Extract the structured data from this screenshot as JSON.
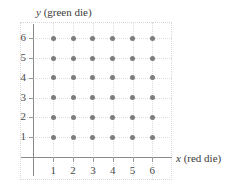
{
  "chart_data": {
    "type": "scatter",
    "title": "",
    "xlabel": "x (red die)",
    "ylabel": "y (green die)",
    "xlabel_var": "x",
    "xlabel_rest": " (red die)",
    "ylabel_var": "y",
    "ylabel_rest": " (green die)",
    "xlim": [
      0,
      7
    ],
    "ylim": [
      0,
      7
    ],
    "xticks": [
      "1",
      "2",
      "3",
      "4",
      "5",
      "6"
    ],
    "yticks": [
      "1",
      "2",
      "3",
      "4",
      "5",
      "6"
    ],
    "grid": true,
    "legend": "none",
    "point_color": "#7d7d7d",
    "axis_color": "#8a8a8a",
    "grid_color": "#dcdcdc",
    "points": [
      {
        "x": 1,
        "y": 1
      },
      {
        "x": 2,
        "y": 1
      },
      {
        "x": 3,
        "y": 1
      },
      {
        "x": 4,
        "y": 1
      },
      {
        "x": 5,
        "y": 1
      },
      {
        "x": 6,
        "y": 1
      },
      {
        "x": 1,
        "y": 2
      },
      {
        "x": 2,
        "y": 2
      },
      {
        "x": 3,
        "y": 2
      },
      {
        "x": 4,
        "y": 2
      },
      {
        "x": 5,
        "y": 2
      },
      {
        "x": 6,
        "y": 2
      },
      {
        "x": 1,
        "y": 3
      },
      {
        "x": 2,
        "y": 3
      },
      {
        "x": 3,
        "y": 3
      },
      {
        "x": 4,
        "y": 3
      },
      {
        "x": 5,
        "y": 3
      },
      {
        "x": 6,
        "y": 3
      },
      {
        "x": 1,
        "y": 4
      },
      {
        "x": 2,
        "y": 4
      },
      {
        "x": 3,
        "y": 4
      },
      {
        "x": 4,
        "y": 4
      },
      {
        "x": 5,
        "y": 4
      },
      {
        "x": 6,
        "y": 4
      },
      {
        "x": 1,
        "y": 5
      },
      {
        "x": 2,
        "y": 5
      },
      {
        "x": 3,
        "y": 5
      },
      {
        "x": 4,
        "y": 5
      },
      {
        "x": 5,
        "y": 5
      },
      {
        "x": 6,
        "y": 5
      },
      {
        "x": 1,
        "y": 6
      },
      {
        "x": 2,
        "y": 6
      },
      {
        "x": 3,
        "y": 6
      },
      {
        "x": 4,
        "y": 6
      },
      {
        "x": 5,
        "y": 6
      },
      {
        "x": 6,
        "y": 6
      }
    ]
  }
}
